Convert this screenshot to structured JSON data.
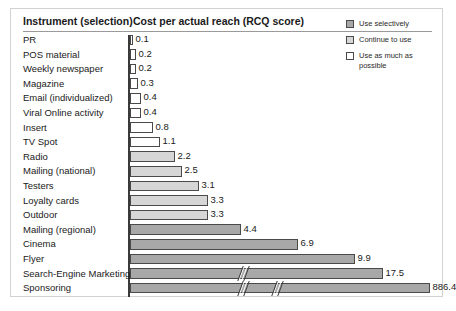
{
  "header": {
    "col_instrument": "Instrument (selection)",
    "col_cost": "Cost per actual reach (RCQ score)"
  },
  "legend": {
    "items": [
      {
        "label": "Use selectively",
        "swatch": "dark",
        "color": "#a8a8a8"
      },
      {
        "label": "Continue to use",
        "swatch": "light",
        "color": "#d6d6d6"
      },
      {
        "label": "Use as much as possible",
        "swatch": "white",
        "color": "#ffffff"
      }
    ]
  },
  "chart_data": {
    "type": "bar",
    "orientation": "horizontal",
    "title": "Cost per actual reach (RCQ score)",
    "xlabel": "",
    "ylabel": "Instrument (selection)",
    "grid": false,
    "legend_position": "top-right",
    "axis_breaks": true,
    "categories": [
      "PR",
      "POS material",
      "Weekly newspaper",
      "Magazine",
      "Email (individualized)",
      "Viral Online activity",
      "Insert",
      "TV Spot",
      "Radio",
      "Mailing (national)",
      "Testers",
      "Loyalty cards",
      "Outdoor",
      "Mailing (regional)",
      "Cinema",
      "Flyer",
      "Search-Engine Marketing",
      "Sponsoring"
    ],
    "values": [
      0.1,
      0.2,
      0.2,
      0.3,
      0.4,
      0.4,
      0.8,
      1.1,
      2.2,
      2.5,
      3.1,
      3.3,
      3.3,
      4.4,
      6.9,
      9.9,
      17.5,
      886.4
    ],
    "value_labels": [
      "0.1",
      "0.2",
      "0.2",
      "0.3",
      "0.4",
      "0.4",
      "0.8",
      "1.1",
      "2.2",
      "2.5",
      "3.1",
      "3.3",
      "3.3",
      "4.4",
      "6.9",
      "9.9",
      "17.5",
      "886.4"
    ],
    "series_groups": [
      "use-as-much-as-possible",
      "use-as-much-as-possible",
      "use-as-much-as-possible",
      "use-as-much-as-possible",
      "use-as-much-as-possible",
      "use-as-much-as-possible",
      "use-as-much-as-possible",
      "use-as-much-as-possible",
      "continue-to-use",
      "continue-to-use",
      "continue-to-use",
      "continue-to-use",
      "continue-to-use",
      "use-selectively",
      "use-selectively",
      "use-selectively",
      "use-selectively",
      "use-selectively"
    ],
    "bar_styles": [
      "white",
      "white",
      "white",
      "white",
      "white",
      "white",
      "white",
      "white",
      "light",
      "light",
      "light",
      "light",
      "light",
      "dark",
      "dark",
      "dark",
      "dark",
      "dark"
    ],
    "bar_pixel_widths": [
      3,
      6,
      6,
      8,
      11,
      11,
      23,
      30,
      45,
      52,
      69,
      78,
      78,
      111,
      168,
      225,
      253,
      300
    ],
    "breaks_per_bar": [
      0,
      0,
      0,
      0,
      0,
      0,
      0,
      0,
      0,
      0,
      0,
      0,
      0,
      0,
      0,
      0,
      1,
      2
    ],
    "break_positions": {
      "17.5": [
        228
      ],
      "886.4": [
        228,
        262
      ]
    }
  }
}
